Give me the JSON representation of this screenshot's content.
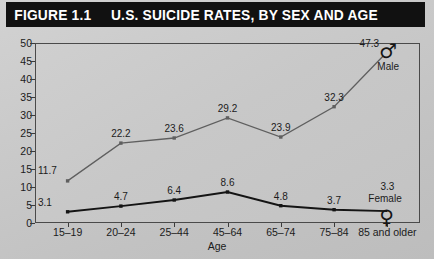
{
  "figure": {
    "number": "FIGURE 1.1",
    "title": "U.S. SUICIDE RATES, BY SEX AND AGE"
  },
  "chart_data": {
    "type": "line",
    "title": "U.S. SUICIDE RATES, BY SEX AND AGE",
    "xlabel": "Age",
    "ylabel": "",
    "categories": [
      "15–19",
      "20–24",
      "25–44",
      "45–64",
      "65–74",
      "75–84",
      "85 and older"
    ],
    "ylim": [
      0,
      50
    ],
    "ytick_step": 5,
    "yticks": [
      "0",
      "5",
      "10",
      "15",
      "20",
      "25",
      "30",
      "35",
      "40",
      "45",
      "50"
    ],
    "grid": false,
    "legend_position": "inline-endpoint-glyphs",
    "series": [
      {
        "name": "Male",
        "glyph": "♂",
        "color": "#5f5f5f",
        "marker": "square",
        "values": [
          11.7,
          22.2,
          23.6,
          29.2,
          23.9,
          32.3,
          47.3
        ],
        "labels": [
          "11.7",
          "22.2",
          "23.6",
          "29.2",
          "23.9",
          "32.3",
          "47.3"
        ]
      },
      {
        "name": "Female",
        "glyph": "♀",
        "color": "#141414",
        "marker": "square",
        "values": [
          3.1,
          4.7,
          6.4,
          8.6,
          4.8,
          3.7,
          3.3
        ],
        "labels": [
          "3.1",
          "4.7",
          "6.4",
          "8.6",
          "4.8",
          "3.7",
          "3.3"
        ]
      }
    ]
  }
}
